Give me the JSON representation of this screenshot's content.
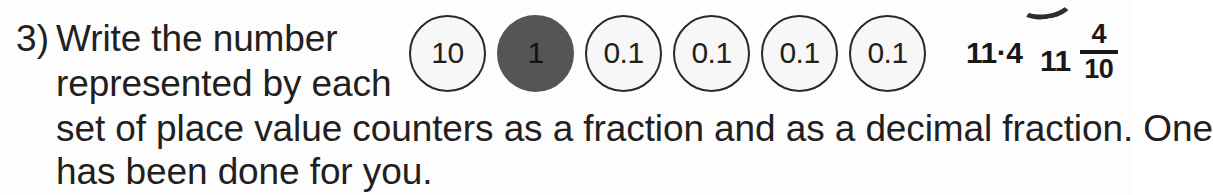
{
  "question": {
    "number_label": "3)",
    "lines": [
      "Write the number",
      "represented by each",
      "set of place value counters as a fraction and as a decimal fraction. One",
      "has been done for you."
    ],
    "full_text": "3) Write the number represented by each set of place value counters as a fraction and as a decimal fraction. One has been done for you."
  },
  "counters": [
    {
      "label": "10",
      "style": "light",
      "name": "counter-tens"
    },
    {
      "label": "1",
      "style": "dark",
      "name": "counter-ones"
    },
    {
      "label": "0.1",
      "style": "light",
      "name": "counter-tenths-1"
    },
    {
      "label": "0.1",
      "style": "light",
      "name": "counter-tenths-2"
    },
    {
      "label": "0.1",
      "style": "light",
      "name": "counter-tenths-3"
    },
    {
      "label": "0.1",
      "style": "light",
      "name": "counter-tenths-4"
    }
  ],
  "answers": {
    "decimal": "11·4",
    "fraction": {
      "whole": "11",
      "numerator": "4",
      "denominator": "10"
    }
  },
  "colors": {
    "page_background": "#fdfdfd",
    "ink": "#231f20",
    "counter_light_fill": "#f7f7f7",
    "counter_outline": "#2b2829",
    "counter_dark_fill": "#565456",
    "answer_ink": "#1a1718"
  }
}
